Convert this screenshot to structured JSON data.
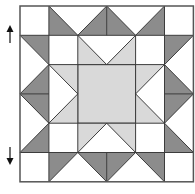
{
  "diagram": {
    "type": "quilt-block",
    "grid": {
      "cols": 6,
      "rows": 6
    },
    "colors": {
      "background": "#ffffff",
      "dark": "#8c8c8c",
      "light": "#d9d9d9",
      "line": "#3c3c3c"
    },
    "center_square": [
      [
        2,
        2
      ],
      [
        4,
        2
      ],
      [
        4,
        4
      ],
      [
        2,
        4
      ]
    ],
    "light_triangles": [
      [
        [
          2,
          1
        ],
        [
          2,
          2
        ],
        [
          3,
          2
        ]
      ],
      [
        [
          4,
          1
        ],
        [
          4,
          2
        ],
        [
          3,
          2
        ]
      ],
      [
        [
          2,
          5
        ],
        [
          2,
          4
        ],
        [
          3,
          4
        ]
      ],
      [
        [
          4,
          5
        ],
        [
          4,
          4
        ],
        [
          3,
          4
        ]
      ],
      [
        [
          1,
          2
        ],
        [
          2,
          2
        ],
        [
          2,
          3
        ]
      ],
      [
        [
          1,
          4
        ],
        [
          2,
          4
        ],
        [
          2,
          3
        ]
      ],
      [
        [
          5,
          2
        ],
        [
          4,
          2
        ],
        [
          4,
          3
        ]
      ],
      [
        [
          5,
          4
        ],
        [
          4,
          4
        ],
        [
          4,
          3
        ]
      ]
    ],
    "dark_triangles": [
      [
        [
          1,
          0
        ],
        [
          1,
          1
        ],
        [
          2,
          1
        ]
      ],
      [
        [
          3,
          0
        ],
        [
          3,
          1
        ],
        [
          2,
          1
        ]
      ],
      [
        [
          3,
          0
        ],
        [
          3,
          1
        ],
        [
          4,
          1
        ]
      ],
      [
        [
          5,
          0
        ],
        [
          5,
          1
        ],
        [
          4,
          1
        ]
      ],
      [
        [
          1,
          6
        ],
        [
          1,
          5
        ],
        [
          2,
          5
        ]
      ],
      [
        [
          3,
          6
        ],
        [
          3,
          5
        ],
        [
          2,
          5
        ]
      ],
      [
        [
          3,
          6
        ],
        [
          3,
          5
        ],
        [
          4,
          5
        ]
      ],
      [
        [
          5,
          6
        ],
        [
          5,
          5
        ],
        [
          4,
          5
        ]
      ],
      [
        [
          0,
          1
        ],
        [
          1,
          1
        ],
        [
          1,
          2
        ]
      ],
      [
        [
          0,
          3
        ],
        [
          1,
          3
        ],
        [
          1,
          2
        ]
      ],
      [
        [
          0,
          3
        ],
        [
          1,
          3
        ],
        [
          1,
          4
        ]
      ],
      [
        [
          0,
          5
        ],
        [
          1,
          5
        ],
        [
          1,
          4
        ]
      ],
      [
        [
          6,
          1
        ],
        [
          5,
          1
        ],
        [
          5,
          2
        ]
      ],
      [
        [
          6,
          3
        ],
        [
          5,
          3
        ],
        [
          5,
          2
        ]
      ],
      [
        [
          6,
          3
        ],
        [
          5,
          3
        ],
        [
          5,
          4
        ]
      ],
      [
        [
          6,
          5
        ],
        [
          5,
          5
        ],
        [
          5,
          4
        ]
      ]
    ],
    "lines": [
      [
        [
          1,
          0
        ],
        [
          1,
          6
        ]
      ],
      [
        [
          5,
          0
        ],
        [
          5,
          6
        ]
      ],
      [
        [
          0,
          1
        ],
        [
          6,
          1
        ]
      ],
      [
        [
          0,
          5
        ],
        [
          6,
          5
        ]
      ],
      [
        [
          3,
          0
        ],
        [
          3,
          1
        ]
      ],
      [
        [
          3,
          5
        ],
        [
          3,
          6
        ]
      ],
      [
        [
          0,
          3
        ],
        [
          1,
          3
        ]
      ],
      [
        [
          5,
          3
        ],
        [
          6,
          3
        ]
      ],
      [
        [
          2,
          1
        ],
        [
          2,
          5
        ]
      ],
      [
        [
          4,
          1
        ],
        [
          4,
          5
        ]
      ],
      [
        [
          1,
          2
        ],
        [
          5,
          2
        ]
      ],
      [
        [
          1,
          4
        ],
        [
          5,
          4
        ]
      ],
      [
        [
          1,
          0
        ],
        [
          2,
          1
        ]
      ],
      [
        [
          2,
          1
        ],
        [
          3,
          0
        ]
      ],
      [
        [
          3,
          0
        ],
        [
          4,
          1
        ]
      ],
      [
        [
          4,
          1
        ],
        [
          5,
          0
        ]
      ],
      [
        [
          1,
          6
        ],
        [
          2,
          5
        ]
      ],
      [
        [
          2,
          5
        ],
        [
          3,
          6
        ]
      ],
      [
        [
          3,
          6
        ],
        [
          4,
          5
        ]
      ],
      [
        [
          4,
          5
        ],
        [
          5,
          6
        ]
      ],
      [
        [
          0,
          1
        ],
        [
          1,
          2
        ]
      ],
      [
        [
          1,
          2
        ],
        [
          0,
          3
        ]
      ],
      [
        [
          0,
          3
        ],
        [
          1,
          4
        ]
      ],
      [
        [
          1,
          4
        ],
        [
          0,
          5
        ]
      ],
      [
        [
          6,
          1
        ],
        [
          5,
          2
        ]
      ],
      [
        [
          5,
          2
        ],
        [
          6,
          3
        ]
      ],
      [
        [
          6,
          3
        ],
        [
          5,
          4
        ]
      ],
      [
        [
          5,
          4
        ],
        [
          6,
          5
        ]
      ],
      [
        [
          2,
          1
        ],
        [
          3,
          2
        ]
      ],
      [
        [
          3,
          2
        ],
        [
          4,
          1
        ]
      ],
      [
        [
          2,
          5
        ],
        [
          3,
          4
        ]
      ],
      [
        [
          3,
          4
        ],
        [
          4,
          5
        ]
      ],
      [
        [
          1,
          2
        ],
        [
          2,
          3
        ]
      ],
      [
        [
          2,
          3
        ],
        [
          1,
          4
        ]
      ],
      [
        [
          5,
          2
        ],
        [
          4,
          3
        ]
      ],
      [
        [
          4,
          3
        ],
        [
          5,
          4
        ]
      ]
    ],
    "arrows": [
      {
        "direction": "up",
        "x": 10,
        "y1": 43,
        "y2": 25
      },
      {
        "direction": "down",
        "x": 10,
        "y1": 147,
        "y2": 165
      }
    ]
  }
}
